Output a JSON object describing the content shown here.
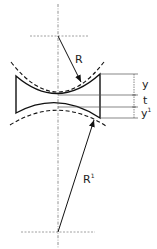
{
  "diagram": {
    "type": "concave lens cross-section with radii of curvature",
    "labels": {
      "radius_top": "R",
      "radius_bottom": "R",
      "radius_bottom_sup": "1",
      "dim_top": "y",
      "dim_middle": "t",
      "dim_bottom": "y",
      "dim_bottom_sup": "1"
    },
    "colors": {
      "stroke": "#111111",
      "guide": "#777777",
      "text": "#222222"
    }
  }
}
